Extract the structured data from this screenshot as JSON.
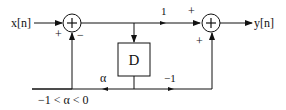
{
  "diagram": {
    "input_label": "x[n]",
    "output_label": "y[n]",
    "delay_label": "D",
    "forward_gain_label": "1",
    "alpha_label": "α",
    "minus_one_label": "−1",
    "constraint_label": "−1 < α < 0",
    "left_summer": {
      "symbol": "+",
      "sign_input": "+",
      "sign_feedback": "−"
    },
    "right_summer": {
      "symbol": "+",
      "sign_top": "+",
      "sign_bottom": "+"
    },
    "colors": {
      "stroke": "#111111",
      "background": "#ffffff"
    }
  }
}
